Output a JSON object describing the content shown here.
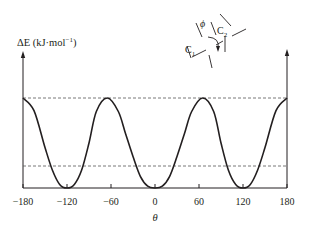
{
  "chart_data": {
    "type": "line",
    "title": "",
    "xlabel": "θ",
    "ylabel": "ΔE (kJ·mol⁻¹)",
    "xlim": [
      -180,
      180
    ],
    "x_ticks": [
      -180,
      -120,
      -60,
      0,
      60,
      120,
      180
    ],
    "x_tick_labels": [
      "−180",
      "−120",
      "−60",
      "0",
      "60",
      "120",
      "180"
    ],
    "y_ticks": [],
    "grid": false,
    "legend": null,
    "series": [
      {
        "name": "Torsional energy",
        "x": [
          -180,
          -165,
          -150,
          -140,
          -130,
          -120,
          -110,
          -100,
          -90,
          -80,
          -65,
          -50,
          -40,
          -30,
          -20,
          -10,
          0,
          10,
          20,
          30,
          40,
          50,
          65,
          80,
          90,
          100,
          110,
          120,
          130,
          140,
          150,
          165,
          180
        ],
        "values": [
          1.0,
          0.86,
          0.45,
          0.2,
          0.04,
          0.0,
          0.04,
          0.2,
          0.5,
          0.85,
          1.0,
          0.85,
          0.6,
          0.35,
          0.13,
          0.02,
          0.0,
          0.02,
          0.13,
          0.35,
          0.6,
          0.85,
          1.0,
          0.85,
          0.5,
          0.2,
          0.04,
          0.0,
          0.04,
          0.2,
          0.45,
          0.86,
          1.0
        ]
      }
    ],
    "reference_lines": [
      {
        "style": "dashed",
        "y_relative": 1.0,
        "label": ""
      },
      {
        "style": "dashed",
        "y_relative": 0.24,
        "label": ""
      }
    ],
    "annotations": [
      {
        "text": "ϕ",
        "note": "dihedral angle symbol in Newman-style inset"
      },
      {
        "text": "C1",
        "note": "carbon atom 1 label"
      },
      {
        "text": "C2",
        "note": "carbon atom 2 label"
      }
    ]
  },
  "labels": {
    "ylabel_main": "ΔE (kJ·mol",
    "ylabel_sup": "−1",
    "ylabel_close": ")",
    "xlabel": "θ",
    "phi": "ϕ",
    "c1": "C",
    "c1_sub": "1",
    "c2": "C",
    "c2_sub": "2"
  },
  "colors": {
    "line": "#231f20",
    "axis": "#231f20",
    "dashed": "#555555"
  }
}
